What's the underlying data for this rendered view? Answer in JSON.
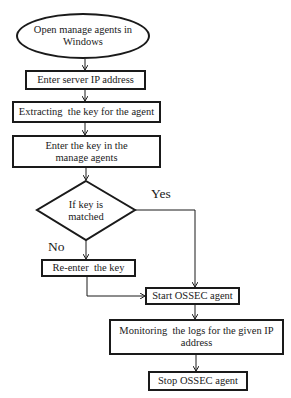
{
  "diagram": {
    "type": "flowchart",
    "colors": {
      "stroke": "#1a1a1a",
      "background": "#ffffff"
    },
    "nodes": {
      "start": {
        "shape": "ellipse",
        "text": "Open manage agents in Windows"
      },
      "enter_ip": {
        "shape": "rect",
        "text": "Enter server IP address"
      },
      "extract_key": {
        "shape": "rect",
        "text": "Extracting  the key for the agent"
      },
      "enter_key": {
        "shape": "rect",
        "text": "Enter the key in the manage agents"
      },
      "decision": {
        "shape": "diamond",
        "text": "If key is matched"
      },
      "reenter": {
        "shape": "rect",
        "text": "Re-enter  the key"
      },
      "start_ossec": {
        "shape": "rect",
        "text": "Start OSSEC agent"
      },
      "monitor": {
        "shape": "rect",
        "text": "Monitoring  the logs for the given IP address"
      },
      "stop_ossec": {
        "shape": "rect",
        "text": "Stop OSSEC agent"
      }
    },
    "edge_labels": {
      "yes": "Yes",
      "no": "No"
    },
    "edges": [
      {
        "from": "start",
        "to": "enter_ip"
      },
      {
        "from": "enter_ip",
        "to": "extract_key"
      },
      {
        "from": "extract_key",
        "to": "enter_key"
      },
      {
        "from": "enter_key",
        "to": "decision"
      },
      {
        "from": "decision",
        "to": "start_ossec",
        "label": "Yes"
      },
      {
        "from": "decision",
        "to": "reenter",
        "label": "No"
      },
      {
        "from": "reenter",
        "to": "start_ossec"
      },
      {
        "from": "start_ossec",
        "to": "monitor"
      },
      {
        "from": "monitor",
        "to": "stop_ossec"
      }
    ]
  }
}
